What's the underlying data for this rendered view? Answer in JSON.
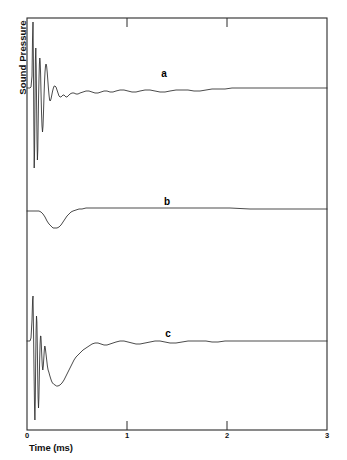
{
  "chart_data": {
    "type": "line",
    "title": "",
    "xlabel": "Time (ms)",
    "ylabel": "Sound Pressure",
    "xlim": [
      0,
      3
    ],
    "ylim": [
      0,
      3
    ],
    "grid": false,
    "legend_position": "inline-annotations",
    "xticks": [
      {
        "value": 0,
        "label": "0"
      },
      {
        "value": 1,
        "label": "1"
      },
      {
        "value": 2,
        "label": "2"
      },
      {
        "value": 3,
        "label": "3"
      }
    ],
    "yticks": [],
    "annotations": [
      {
        "text": "a",
        "x": 1.37,
        "y_px": 73
      },
      {
        "text": "b",
        "x": 1.4,
        "y_px": 201
      },
      {
        "text": "c",
        "x": 1.41,
        "y_px": 333
      }
    ],
    "series": [
      {
        "name": "a",
        "label": "a",
        "description": "Sharp impulsive transient with rapid damped ringing settling to baseline",
        "baseline_px": 88,
        "points_px": [
          [
            27,
            88
          ],
          [
            30,
            88
          ],
          [
            31,
            87
          ],
          [
            32,
            76
          ],
          [
            32.5,
            40
          ],
          [
            33,
            22
          ],
          [
            33.4,
            60
          ],
          [
            33.8,
            120
          ],
          [
            34.2,
            168
          ],
          [
            34.6,
            150
          ],
          [
            35,
            100
          ],
          [
            35.4,
            60
          ],
          [
            35.8,
            48
          ],
          [
            36.2,
            66
          ],
          [
            36.6,
            104
          ],
          [
            37,
            140
          ],
          [
            37.4,
            160
          ],
          [
            37.8,
            150
          ],
          [
            38.2,
            122
          ],
          [
            38.6,
            96
          ],
          [
            39,
            78
          ],
          [
            39.4,
            64
          ],
          [
            39.8,
            58
          ],
          [
            40.2,
            62
          ],
          [
            40.6,
            74
          ],
          [
            41,
            92
          ],
          [
            41.5,
            112
          ],
          [
            42,
            126
          ],
          [
            42.5,
            132
          ],
          [
            43,
            126
          ],
          [
            43.5,
            112
          ],
          [
            44,
            96
          ],
          [
            44.5,
            82
          ],
          [
            45,
            72
          ],
          [
            45.5,
            66
          ],
          [
            46,
            64
          ],
          [
            46.6,
            66
          ],
          [
            47.2,
            72
          ],
          [
            47.8,
            80
          ],
          [
            48.4,
            88
          ],
          [
            49,
            95
          ],
          [
            49.6,
            100
          ],
          [
            50.2,
            101
          ],
          [
            51,
            99
          ],
          [
            51.8,
            95
          ],
          [
            52.6,
            91
          ],
          [
            53.4,
            88
          ],
          [
            54.2,
            86
          ],
          [
            55,
            86
          ],
          [
            56,
            87
          ],
          [
            57,
            90
          ],
          [
            58,
            93
          ],
          [
            59,
            96
          ],
          [
            60,
            97
          ],
          [
            61,
            97
          ],
          [
            62,
            96
          ],
          [
            63,
            95
          ],
          [
            64,
            95
          ],
          [
            65,
            96
          ],
          [
            66,
            97
          ],
          [
            67,
            97
          ],
          [
            68,
            96
          ],
          [
            69,
            95
          ],
          [
            70,
            94
          ],
          [
            72,
            93
          ],
          [
            74,
            93
          ],
          [
            76,
            94
          ],
          [
            78,
            94
          ],
          [
            80,
            93
          ],
          [
            83,
            92
          ],
          [
            86,
            91
          ],
          [
            89,
            91
          ],
          [
            92,
            92
          ],
          [
            95,
            93
          ],
          [
            98,
            93
          ],
          [
            101,
            92
          ],
          [
            104,
            91
          ],
          [
            107,
            91
          ],
          [
            110,
            92
          ],
          [
            113,
            92
          ],
          [
            116,
            91
          ],
          [
            120,
            90
          ],
          [
            124,
            90
          ],
          [
            128,
            91
          ],
          [
            132,
            92
          ],
          [
            136,
            92
          ],
          [
            140,
            91
          ],
          [
            145,
            90
          ],
          [
            150,
            90
          ],
          [
            155,
            91
          ],
          [
            160,
            92
          ],
          [
            165,
            92
          ],
          [
            170,
            91
          ],
          [
            176,
            90
          ],
          [
            182,
            90
          ],
          [
            188,
            90
          ],
          [
            194,
            91
          ],
          [
            200,
            91
          ],
          [
            206,
            90
          ],
          [
            212,
            89
          ],
          [
            218,
            89
          ],
          [
            225,
            89
          ],
          [
            232,
            88
          ],
          [
            240,
            88
          ],
          [
            250,
            88
          ],
          [
            260,
            88
          ],
          [
            270,
            88
          ],
          [
            285,
            88
          ],
          [
            300,
            88
          ],
          [
            315,
            88
          ],
          [
            327,
            88
          ]
        ]
      },
      {
        "name": "b",
        "label": "b",
        "description": "Smooth low-frequency single negative dip returning to baseline",
        "baseline_px": 211,
        "points_px": [
          [
            27,
            211
          ],
          [
            32,
            211
          ],
          [
            36,
            211
          ],
          [
            39,
            211
          ],
          [
            41,
            212
          ],
          [
            43,
            214
          ],
          [
            45,
            217
          ],
          [
            47,
            221
          ],
          [
            49,
            224
          ],
          [
            51,
            226
          ],
          [
            53,
            228
          ],
          [
            55,
            228
          ],
          [
            57,
            228
          ],
          [
            59,
            227
          ],
          [
            61,
            225
          ],
          [
            63,
            222
          ],
          [
            65,
            219
          ],
          [
            67,
            216
          ],
          [
            69,
            214
          ],
          [
            71,
            212
          ],
          [
            73,
            211
          ],
          [
            76,
            210
          ],
          [
            79,
            209
          ],
          [
            82,
            209
          ],
          [
            86,
            208
          ],
          [
            90,
            208
          ],
          [
            95,
            208
          ],
          [
            100,
            208
          ],
          [
            106,
            208
          ],
          [
            112,
            208
          ],
          [
            118,
            208
          ],
          [
            125,
            208
          ],
          [
            132,
            208
          ],
          [
            140,
            208
          ],
          [
            150,
            208
          ],
          [
            160,
            208
          ],
          [
            170,
            208
          ],
          [
            180,
            208
          ],
          [
            190,
            208
          ],
          [
            200,
            208
          ],
          [
            215,
            208
          ],
          [
            230,
            208
          ],
          [
            250,
            209
          ],
          [
            270,
            209
          ],
          [
            290,
            209
          ],
          [
            310,
            209
          ],
          [
            327,
            209
          ]
        ]
      },
      {
        "name": "c",
        "label": "c",
        "description": "Combined sharp transient ringing plus broad low-frequency dip",
        "baseline_px": 341,
        "points_px": [
          [
            27,
            341
          ],
          [
            30,
            341
          ],
          [
            31,
            338
          ],
          [
            32,
            320
          ],
          [
            32.6,
            300
          ],
          [
            33,
            296
          ],
          [
            33.5,
            330
          ],
          [
            34,
            370
          ],
          [
            34.5,
            405
          ],
          [
            34.9,
            420
          ],
          [
            35.3,
            400
          ],
          [
            35.7,
            360
          ],
          [
            36.1,
            330
          ],
          [
            36.5,
            316
          ],
          [
            36.9,
            322
          ],
          [
            37.3,
            345
          ],
          [
            37.7,
            375
          ],
          [
            38.1,
            398
          ],
          [
            38.5,
            408
          ],
          [
            38.9,
            398
          ],
          [
            39.3,
            378
          ],
          [
            39.7,
            358
          ],
          [
            40.1,
            344
          ],
          [
            40.5,
            336
          ],
          [
            40.9,
            336
          ],
          [
            41.3,
            344
          ],
          [
            41.8,
            356
          ],
          [
            42.3,
            366
          ],
          [
            42.8,
            370
          ],
          [
            43.3,
            366
          ],
          [
            43.8,
            358
          ],
          [
            44.3,
            350
          ],
          [
            44.8,
            346
          ],
          [
            45.3,
            348
          ],
          [
            46,
            354
          ],
          [
            46.7,
            360
          ],
          [
            47.4,
            366
          ],
          [
            48.1,
            370
          ],
          [
            48.8,
            372
          ],
          [
            49.6,
            375
          ],
          [
            50.5,
            378
          ],
          [
            51.5,
            381
          ],
          [
            52.5,
            383
          ],
          [
            53.5,
            384
          ],
          [
            55,
            385
          ],
          [
            56.5,
            386
          ],
          [
            58,
            386
          ],
          [
            60,
            385
          ],
          [
            62,
            383
          ],
          [
            64,
            380
          ],
          [
            66,
            376
          ],
          [
            68,
            372
          ],
          [
            70,
            368
          ],
          [
            72,
            364
          ],
          [
            74,
            360
          ],
          [
            76,
            357
          ],
          [
            78,
            355
          ],
          [
            80,
            353
          ],
          [
            83,
            350
          ],
          [
            86,
            348
          ],
          [
            89,
            346
          ],
          [
            92,
            344
          ],
          [
            95,
            343
          ],
          [
            98,
            343
          ],
          [
            101,
            344
          ],
          [
            104,
            345
          ],
          [
            107,
            345
          ],
          [
            110,
            344
          ],
          [
            113,
            343
          ],
          [
            116,
            342
          ],
          [
            120,
            341
          ],
          [
            124,
            341
          ],
          [
            128,
            342
          ],
          [
            132,
            343
          ],
          [
            136,
            344
          ],
          [
            140,
            344
          ],
          [
            145,
            343
          ],
          [
            150,
            342
          ],
          [
            155,
            341
          ],
          [
            160,
            341
          ],
          [
            165,
            342
          ],
          [
            170,
            343
          ],
          [
            176,
            343
          ],
          [
            182,
            342
          ],
          [
            188,
            341
          ],
          [
            194,
            341
          ],
          [
            200,
            341
          ],
          [
            206,
            341
          ],
          [
            212,
            342
          ],
          [
            218,
            342
          ],
          [
            225,
            341
          ],
          [
            232,
            341
          ],
          [
            240,
            341
          ],
          [
            250,
            341
          ],
          [
            262,
            341
          ],
          [
            275,
            341
          ],
          [
            290,
            341
          ],
          [
            305,
            341
          ],
          [
            320,
            341
          ],
          [
            327,
            341
          ]
        ]
      }
    ]
  },
  "axes": {
    "frame": {
      "left_px": 27,
      "right_px": 327,
      "top_px": 18,
      "bottom_px": 430
    },
    "line_color": "#2b2b2b"
  }
}
